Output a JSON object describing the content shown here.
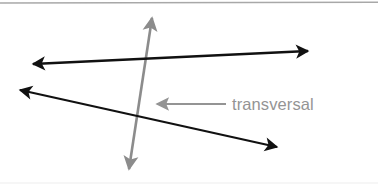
{
  "figure": {
    "width": 378,
    "height": 189,
    "background_color": "#ffffff",
    "label": {
      "text": "transversal",
      "color": "#949494",
      "x": 232,
      "y": 110,
      "font_size": 16.5
    },
    "colors": {
      "line_black": "#111111",
      "transversal_gray": "#8c8c8c",
      "pointer_gray": "#949494",
      "border_top": "#a8a8a8",
      "border_bottom": "#f2f2f2"
    },
    "borders": {
      "top_line_y": 3,
      "bottom_line_y": 183
    },
    "lines": [
      {
        "name": "parallel-line-upper",
        "color": "#111111",
        "stroke_width": 2.3,
        "x1": 33,
        "y1": 64,
        "x2": 308,
        "y2": 51,
        "arrow_start": true,
        "arrow_end": true
      },
      {
        "name": "parallel-line-lower",
        "color": "#111111",
        "stroke_width": 2.3,
        "x1": 20,
        "y1": 90,
        "x2": 277,
        "y2": 147,
        "arrow_start": true,
        "arrow_end": true
      },
      {
        "name": "transversal-line",
        "color": "#8c8c8c",
        "stroke_width": 2.6,
        "x1": 152,
        "y1": 18,
        "x2": 129,
        "y2": 169,
        "arrow_start": true,
        "arrow_end": true
      }
    ],
    "pointer": {
      "name": "transversal-pointer-arrow",
      "color": "#949494",
      "stroke_width": 2.2,
      "x1": 226,
      "y1": 104,
      "x2": 155,
      "y2": 104,
      "arrow_end": true
    }
  }
}
